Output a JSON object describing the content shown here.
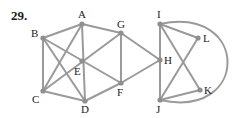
{
  "problem_number": "29.",
  "colors": {
    "edge": "#9a9a9a",
    "node": "#8f8f8f",
    "label": "#222222"
  },
  "nodes": [
    {
      "id": "A",
      "x": 82,
      "y": 24,
      "lx": 78,
      "ly": 18
    },
    {
      "id": "B",
      "x": 43,
      "y": 38,
      "lx": 31,
      "ly": 37
    },
    {
      "id": "C",
      "x": 43,
      "y": 91,
      "lx": 32,
      "ly": 103
    },
    {
      "id": "D",
      "x": 85,
      "y": 101,
      "lx": 81,
      "ly": 113
    },
    {
      "id": "E",
      "x": 82,
      "y": 61,
      "lx": 74,
      "ly": 75
    },
    {
      "id": "F",
      "x": 121,
      "y": 83,
      "lx": 117,
      "ly": 96
    },
    {
      "id": "G",
      "x": 121,
      "y": 33,
      "lx": 117,
      "ly": 28
    },
    {
      "id": "H",
      "x": 160,
      "y": 60,
      "lx": 164,
      "ly": 64
    },
    {
      "id": "I",
      "x": 160,
      "y": 24,
      "lx": 157,
      "ly": 18
    },
    {
      "id": "J",
      "x": 160,
      "y": 100,
      "lx": 156,
      "ly": 113
    },
    {
      "id": "K",
      "x": 200,
      "y": 90,
      "lx": 204,
      "ly": 94
    },
    {
      "id": "L",
      "x": 198,
      "y": 38,
      "lx": 203,
      "ly": 42
    }
  ],
  "edges": [
    [
      "B",
      "A"
    ],
    [
      "B",
      "C"
    ],
    [
      "B",
      "D"
    ],
    [
      "B",
      "F"
    ],
    [
      "A",
      "C"
    ],
    [
      "A",
      "D"
    ],
    [
      "A",
      "G"
    ],
    [
      "C",
      "G"
    ],
    [
      "C",
      "D"
    ],
    [
      "D",
      "F"
    ],
    [
      "G",
      "F"
    ],
    [
      "G",
      "H"
    ],
    [
      "F",
      "H"
    ],
    [
      "I",
      "J"
    ],
    [
      "I",
      "L"
    ],
    [
      "I",
      "K"
    ],
    [
      "J",
      "L"
    ],
    [
      "J",
      "K"
    ]
  ],
  "arc": {
    "from": "I",
    "to": "J",
    "path": "M160 24 C 250 5, 250 120, 160 100"
  }
}
